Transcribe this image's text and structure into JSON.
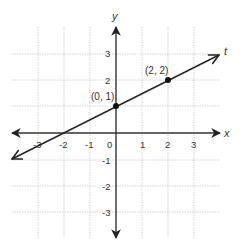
{
  "diagram": {
    "type": "coordinate-plane-line",
    "axes": {
      "x_label": "x",
      "y_label": "y"
    },
    "x_ticks": [
      "-3",
      "-2",
      "-1",
      "0",
      "1",
      "2",
      "3"
    ],
    "y_ticks": [
      "3",
      "2",
      "-1",
      "-2",
      "-3"
    ],
    "line": {
      "label": "t",
      "slope": 0.5,
      "y_intercept": 1
    },
    "points": [
      {
        "label": "(0, 1)",
        "x": 0,
        "y": 1
      },
      {
        "label": "(2, 2)",
        "x": 2,
        "y": 2
      }
    ],
    "colors": {
      "axis": "#333333",
      "grid": "#c8c8c8",
      "line": "#222222"
    }
  }
}
